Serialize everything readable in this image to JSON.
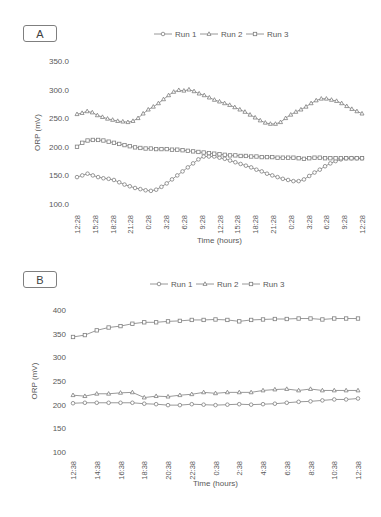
{
  "chart_data": [
    {
      "panel": "A",
      "type": "line",
      "title": "",
      "xlabel": "Time (hours)",
      "ylabel": "ORP (mV)",
      "ylim": [
        100,
        350
      ],
      "yticks": [
        "100.0",
        "150.0",
        "200.0",
        "250.0",
        "300.0",
        "350.0"
      ],
      "xtick_labels": [
        "12:28",
        "15:28",
        "18:28",
        "21:28",
        "0:28",
        "3:28",
        "6:28",
        "9:28",
        "12:28",
        "15:28",
        "18:28",
        "21:28",
        "0:28",
        "3:28",
        "6:28",
        "9:28",
        "12:28"
      ],
      "grid": false,
      "legend_position": "top",
      "series": [
        {
          "name": "Run 1",
          "marker": "circle",
          "values": [
            147,
            150,
            153,
            150,
            147,
            145,
            144,
            142,
            138,
            134,
            131,
            128,
            126,
            124,
            123,
            125,
            130,
            136,
            143,
            150,
            157,
            164,
            171,
            178,
            183,
            183,
            183,
            181,
            179,
            176,
            173,
            170,
            167,
            164,
            160,
            157,
            153,
            150,
            147,
            144,
            142,
            140,
            140,
            143,
            149,
            155,
            160,
            166,
            171,
            175,
            178,
            180,
            180,
            180,
            180
          ]
        },
        {
          "name": "Run 2",
          "marker": "triangle",
          "values": [
            257,
            259,
            262,
            260,
            255,
            252,
            249,
            247,
            245,
            244,
            243,
            245,
            250,
            258,
            265,
            270,
            276,
            283,
            290,
            296,
            299,
            298,
            300,
            297,
            293,
            290,
            286,
            282,
            279,
            276,
            273,
            269,
            265,
            261,
            256,
            251,
            246,
            242,
            240,
            240,
            243,
            250,
            256,
            261,
            265,
            270,
            276,
            281,
            284,
            284,
            282,
            280,
            276,
            271,
            266,
            262,
            258
          ]
        },
        {
          "name": "Run 3",
          "marker": "square",
          "values": [
            200,
            207,
            211,
            212,
            212,
            211,
            209,
            207,
            205,
            203,
            201,
            199,
            198,
            197,
            197,
            196,
            196,
            196,
            195,
            195,
            194,
            193,
            192,
            191,
            190,
            189,
            188,
            187,
            186,
            185,
            185,
            184,
            184,
            183,
            183,
            182,
            182,
            182,
            181,
            181,
            181,
            181,
            180,
            179,
            180,
            181,
            181,
            180,
            180,
            180,
            180,
            180,
            180,
            180,
            180
          ]
        }
      ]
    },
    {
      "panel": "B",
      "type": "line",
      "title": "",
      "xlabel": "Time (hours)",
      "ylabel": "ORP (mV)",
      "ylim": [
        100,
        400
      ],
      "yticks": [
        "100",
        "150",
        "200",
        "250",
        "300",
        "350",
        "400"
      ],
      "xtick_labels": [
        "12:38",
        "14:38",
        "16:38",
        "18:38",
        "20:38",
        "22:38",
        "0:38",
        "2:38",
        "4:38",
        "6:38",
        "8:38",
        "10:38",
        "12:38"
      ],
      "grid": false,
      "legend_position": "top",
      "series": [
        {
          "name": "Run 1",
          "marker": "circle",
          "values": [
            203,
            204,
            204,
            204,
            204,
            204,
            202,
            201,
            199,
            199,
            201,
            200,
            199,
            200,
            201,
            200,
            201,
            202,
            204,
            206,
            207,
            209,
            211,
            211,
            213
          ]
        },
        {
          "name": "Run 2",
          "marker": "triangle",
          "values": [
            220,
            218,
            223,
            223,
            225,
            226,
            215,
            218,
            217,
            220,
            222,
            226,
            224,
            226,
            226,
            226,
            230,
            232,
            233,
            230,
            233,
            230,
            230,
            230,
            230
          ]
        },
        {
          "name": "Run 3",
          "marker": "square",
          "values": [
            343,
            347,
            357,
            363,
            366,
            371,
            374,
            374,
            376,
            377,
            379,
            379,
            380,
            379,
            376,
            379,
            380,
            381,
            381,
            382,
            382,
            380,
            382,
            382,
            382
          ]
        }
      ]
    }
  ],
  "panels": {
    "A": {
      "label": "A",
      "legend": [
        "Run 1",
        "Run 2",
        "Run 3"
      ],
      "xlabel": "Time (hours)",
      "ylabel": "ORP (mV)"
    },
    "B": {
      "label": "B",
      "legend": [
        "Run 1",
        "Run 2",
        "Run 3"
      ],
      "xlabel": "Time (hours)",
      "ylabel": "ORP (mV)"
    }
  },
  "colors": {
    "line": "#7f7f7f",
    "text": "#595959",
    "box_border": "#7f7f7f"
  }
}
